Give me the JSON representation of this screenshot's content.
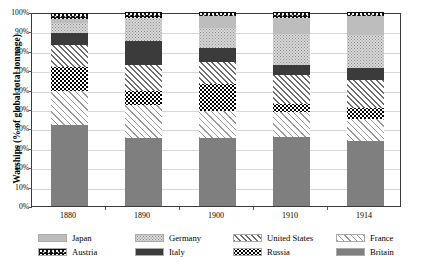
{
  "chart_data": {
    "type": "bar",
    "subtype": "stacked-percentage-bar",
    "title": "",
    "xlabel": "",
    "ylabel": "Warships (% of global total tonnage)",
    "categories": [
      "1880",
      "1890",
      "1900",
      "1910",
      "1914"
    ],
    "ylim": [
      0,
      100
    ],
    "ytick_labels": [
      "0%",
      "10%",
      "20%",
      "30%",
      "40%",
      "50%",
      "60%",
      "70%",
      "80%",
      "90%",
      "100%"
    ],
    "ytick_values": [
      0,
      10,
      20,
      30,
      40,
      50,
      60,
      70,
      80,
      90,
      100
    ],
    "grid": true,
    "legend_position": "bottom",
    "stack_order_bottom_to_top": [
      "Britain",
      "France",
      "Russia",
      "United States",
      "Italy",
      "Germany",
      "Japan",
      "Austria"
    ],
    "series": [
      {
        "name": "Britain",
        "values": [
          42.0,
          35.0,
          35.0,
          35.5,
          33.5
        ]
      },
      {
        "name": "France",
        "values": [
          17.5,
          17.0,
          14.0,
          13.0,
          11.5
        ]
      },
      {
        "name": "Russia",
        "values": [
          12.0,
          7.5,
          14.0,
          4.0,
          5.5
        ]
      },
      {
        "name": "United States",
        "values": [
          11.5,
          13.0,
          11.0,
          15.0,
          14.5
        ]
      },
      {
        "name": "Italy",
        "values": [
          6.0,
          12.5,
          7.5,
          5.0,
          6.0
        ]
      },
      {
        "name": "Germany",
        "values": [
          5.5,
          12.0,
          10.5,
          16.0,
          17.0
        ]
      },
      {
        "name": "Japan",
        "values": [
          2.0,
          0.0,
          6.0,
          8.5,
          10.0
        ]
      },
      {
        "name": "Austria",
        "values": [
          3.0,
          3.0,
          2.0,
          3.0,
          2.0
        ]
      }
    ]
  },
  "legend": {
    "items": [
      {
        "label": "Japan",
        "pattern": "solid-light-gray"
      },
      {
        "label": "Germany",
        "pattern": "light-speckle"
      },
      {
        "label": "United States",
        "pattern": "diagonal-hatch-dense"
      },
      {
        "label": "France",
        "pattern": "diagonal-hatch-sparse"
      },
      {
        "label": "Austria",
        "pattern": "black-speckle"
      },
      {
        "label": "Italy",
        "pattern": "solid-dark-gray"
      },
      {
        "label": "Russia",
        "pattern": "dense-black-dots"
      },
      {
        "label": "Britain",
        "pattern": "solid-medium-gray"
      }
    ]
  },
  "colors": {
    "britain": "#7f7f7f",
    "italy": "#3b3b3b",
    "japan": "#bdbdbd",
    "germany": "#d9d9d9",
    "austria": "#0d0d0d",
    "axis": "#3a3a3a",
    "grid": "#d8d8d8"
  }
}
